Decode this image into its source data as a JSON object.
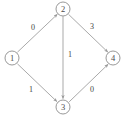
{
  "figure": {
    "type": "directed-graph",
    "background_color": "#ffffff",
    "node_stroke_color": "#8d8d8d",
    "edge_stroke_color": "#9a9a9a",
    "label_color": "#3f3f3f"
  },
  "graph": {
    "nodes": [
      {
        "id": "1",
        "label": "1",
        "cx": 12,
        "cy": 58,
        "r": 7
      },
      {
        "id": "2",
        "label": "2",
        "cx": 63,
        "cy": 9,
        "r": 7
      },
      {
        "id": "3",
        "label": "3",
        "cx": 63,
        "cy": 107,
        "r": 7
      },
      {
        "id": "4",
        "label": "4",
        "cx": 113,
        "cy": 58,
        "r": 7
      }
    ],
    "edges": [
      {
        "id": "e12",
        "from": "1",
        "to": "2",
        "weight": "0",
        "label_x": 33,
        "label_y": 27
      },
      {
        "id": "e24",
        "from": "2",
        "to": "4",
        "weight": "3",
        "label_x": 92,
        "label_y": 26
      },
      {
        "id": "e23",
        "from": "2",
        "to": "3",
        "weight": "1",
        "label_x": 70,
        "label_y": 54
      },
      {
        "id": "e13",
        "from": "1",
        "to": "3",
        "weight": "1",
        "label_x": 31,
        "label_y": 89
      },
      {
        "id": "e34",
        "from": "3",
        "to": "4",
        "weight": "0",
        "label_x": 92,
        "label_y": 89
      }
    ]
  }
}
